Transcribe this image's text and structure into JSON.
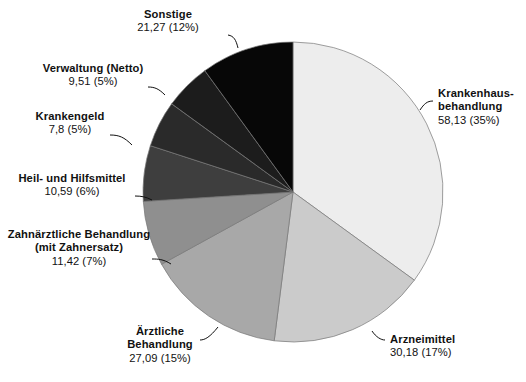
{
  "chart_data": {
    "type": "pie",
    "title": "",
    "subtitle": "",
    "xlabel": "",
    "ylabel": "",
    "legend_position": "callout-labels",
    "grid": false,
    "value_unit": "Mrd. Euro",
    "categories": [
      "Krankenhausbehandlung",
      "Arzneimittel",
      "Ärztliche Behandlung",
      "Zahnärztliche Behandlung (mit Zahnersatz)",
      "Heil- und Hilfsmittel",
      "Krankengeld",
      "Verwaltung (Netto)",
      "Sonstige"
    ],
    "values": [
      58.13,
      30.18,
      27.09,
      11.42,
      10.59,
      7.8,
      9.51,
      21.27
    ],
    "percents": [
      35,
      17,
      15,
      7,
      6,
      5,
      5,
      12
    ],
    "colors": [
      "#ededed",
      "#cbcbcb",
      "#a8a8a8",
      "#8f8f8f",
      "#3e3e3e",
      "#2a2a2a",
      "#1c1c1c",
      "#070707"
    ],
    "slices": [
      {
        "key": "krankenhausbehandlung",
        "name_line1": "Krankenhaus-",
        "name_line2": "behandlung",
        "value_text": "58,13 (35%)",
        "value": 58.13,
        "percent": 35,
        "color": "#ededed",
        "start_angle": 0,
        "end_angle": 126
      },
      {
        "key": "arzneimittel",
        "name_line1": "Arzneimittel",
        "name_line2": "",
        "value_text": "30,18 (17%)",
        "value": 30.18,
        "percent": 17,
        "color": "#cbcbcb",
        "start_angle": 126,
        "end_angle": 187.2
      },
      {
        "key": "aerztliche-behandlung",
        "name_line1": "Ärztliche",
        "name_line2": "Behandlung",
        "value_text": "27,09 (15%)",
        "value": 27.09,
        "percent": 15,
        "color": "#a8a8a8",
        "start_angle": 187.2,
        "end_angle": 241.2
      },
      {
        "key": "zahnaerztliche-behandlung",
        "name_line1": "Zahnärztliche Behandlung",
        "name_line2": "(mit Zahnersatz)",
        "value_text": "11,42 (7%)",
        "value": 11.42,
        "percent": 7,
        "color": "#8f8f8f",
        "start_angle": 241.2,
        "end_angle": 266.4
      },
      {
        "key": "heil-und-hilfsmittel",
        "name_line1": "Heil- und Hilfsmittel",
        "name_line2": "",
        "value_text": "10,59 (6%)",
        "value": 10.59,
        "percent": 6,
        "color": "#3e3e3e",
        "start_angle": 266.4,
        "end_angle": 288
      },
      {
        "key": "krankengeld",
        "name_line1": "Krankengeld",
        "name_line2": "",
        "value_text": "7,8 (5%)",
        "value": 7.8,
        "percent": 5,
        "color": "#2a2a2a",
        "start_angle": 288,
        "end_angle": 306
      },
      {
        "key": "verwaltung-netto",
        "name_line1": "Verwaltung (Netto)",
        "name_line2": "",
        "value_text": "9,51 (5%)",
        "value": 9.51,
        "percent": 5,
        "color": "#1c1c1c",
        "start_angle": 306,
        "end_angle": 324
      },
      {
        "key": "sonstige",
        "name_line1": "Sonstige",
        "name_line2": "",
        "value_text": "21,27 (12%)",
        "value": 21.27,
        "percent": 12,
        "color": "#070707",
        "start_angle": 324,
        "end_angle": 360
      }
    ]
  }
}
